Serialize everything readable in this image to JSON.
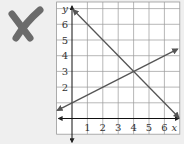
{
  "mark": {
    "symbol": "X",
    "color": "#6b6b6b",
    "meaning": "incorrect"
  },
  "graph": {
    "x_label": "x",
    "y_label": "y",
    "x_ticks": [
      "1",
      "2",
      "3",
      "4",
      "5",
      "6"
    ],
    "y_ticks": [
      "2",
      "3",
      "4",
      "5",
      "6"
    ],
    "grid_color": "#9a9a9a",
    "axis_color": "#111111",
    "line_color": "#555555"
  },
  "chart_data": {
    "type": "line",
    "title": "",
    "xlabel": "x",
    "ylabel": "y",
    "xlim": [
      -1,
      7
    ],
    "ylim": [
      -1,
      7.5
    ],
    "grid": true,
    "series": [
      {
        "name": "line 1",
        "equation": "y = -x + 7",
        "points": [
          [
            0,
            7
          ],
          [
            4,
            3
          ],
          [
            7,
            0
          ]
        ]
      },
      {
        "name": "line 2",
        "equation": "y = 0.5x + 1",
        "points": [
          [
            -1,
            0.5
          ],
          [
            0,
            1
          ],
          [
            4,
            3
          ],
          [
            6.8,
            4.4
          ]
        ]
      }
    ],
    "annotations": [
      {
        "label": "intersection",
        "x": 4,
        "y": 3
      }
    ]
  }
}
